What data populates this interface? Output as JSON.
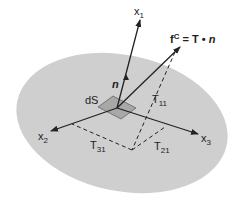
{
  "diagram": {
    "labels": {
      "x1": {
        "base": "x",
        "sub": "1"
      },
      "x2": {
        "base": "x",
        "sub": "2"
      },
      "x3": {
        "base": "x",
        "sub": "3"
      },
      "n": "n",
      "dS": "dS",
      "T11": {
        "base": "T",
        "sub": "11"
      },
      "T21": {
        "base": "T",
        "sub": "21"
      },
      "T31": {
        "base": "T",
        "sub": "31"
      },
      "traction": {
        "f": "f",
        "sup": "C",
        "eq": " = T • ",
        "n": "n"
      }
    },
    "colors": {
      "surface": "#cfcfcf",
      "element": "#a8a8a8",
      "stroke": "#222222"
    }
  }
}
